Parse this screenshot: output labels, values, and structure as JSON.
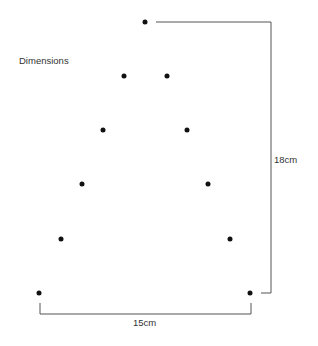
{
  "title": "Dimensions",
  "dimensions": {
    "height_label": "18cm",
    "width_label": "15cm"
  },
  "points": [
    {
      "x": 145,
      "y": 22
    },
    {
      "x": 124,
      "y": 76
    },
    {
      "x": 167,
      "y": 76
    },
    {
      "x": 103,
      "y": 130
    },
    {
      "x": 187,
      "y": 130
    },
    {
      "x": 82,
      "y": 184
    },
    {
      "x": 208,
      "y": 184
    },
    {
      "x": 61,
      "y": 239
    },
    {
      "x": 230,
      "y": 239
    },
    {
      "x": 39,
      "y": 293
    },
    {
      "x": 250,
      "y": 293
    }
  ],
  "colors": {
    "dot": "#111111",
    "line": "#555555",
    "text": "#333333"
  }
}
